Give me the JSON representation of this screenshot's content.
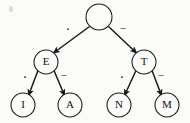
{
  "diagram": {
    "type": "binary-tree",
    "background_color": "#fbfbf9",
    "stroke_color": "#1a1a1a",
    "nodes": [
      {
        "id": "root",
        "label": "",
        "cx": 99,
        "cy": 17,
        "r": 13
      },
      {
        "id": "e",
        "label": "E",
        "cx": 46,
        "cy": 62,
        "r": 12
      },
      {
        "id": "t",
        "label": "T",
        "cx": 144,
        "cy": 62,
        "r": 12
      },
      {
        "id": "i",
        "label": "I",
        "cx": 23,
        "cy": 105,
        "r": 12
      },
      {
        "id": "a",
        "label": "A",
        "cx": 70,
        "cy": 105,
        "r": 12
      },
      {
        "id": "n",
        "label": "N",
        "cx": 119,
        "cy": 105,
        "r": 12
      },
      {
        "id": "m",
        "label": "M",
        "cx": 167,
        "cy": 105,
        "r": 12
      }
    ],
    "edges": [
      {
        "id": "root-e",
        "from": "root",
        "to": "e",
        "label": "·",
        "symbol": "dot",
        "lx": 68,
        "ly": 31
      },
      {
        "id": "root-t",
        "from": "root",
        "to": "t",
        "label": "–",
        "symbol": "dash",
        "lx": 123,
        "ly": 29
      },
      {
        "id": "e-i",
        "from": "e",
        "to": "i",
        "label": "·",
        "symbol": "dot",
        "lx": 25,
        "ly": 79
      },
      {
        "id": "e-a",
        "from": "e",
        "to": "a",
        "label": "–",
        "symbol": "dash",
        "lx": 64,
        "ly": 76
      },
      {
        "id": "t-n",
        "from": "t",
        "to": "n",
        "label": "·",
        "symbol": "dot",
        "lx": 122,
        "ly": 79
      },
      {
        "id": "t-m",
        "from": "t",
        "to": "m",
        "label": "–",
        "symbol": "dash",
        "lx": 161,
        "ly": 76
      }
    ]
  }
}
